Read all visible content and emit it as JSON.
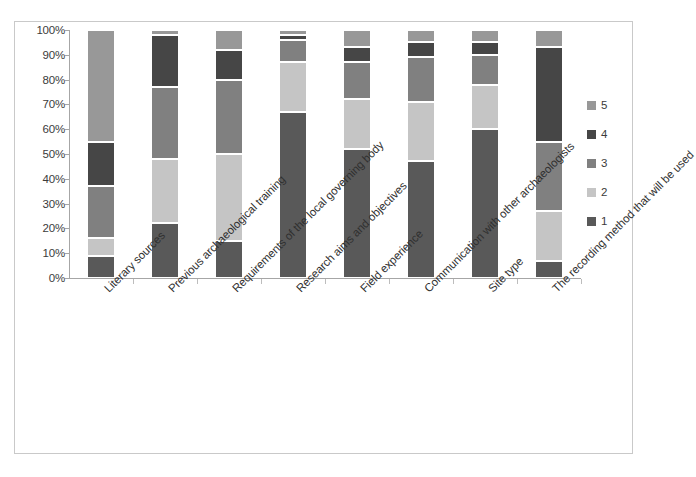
{
  "chart_data": {
    "type": "bar",
    "subtype": "stacked-percent",
    "title": "",
    "xlabel": "",
    "ylabel": "",
    "ylim": [
      0,
      100
    ],
    "grid": false,
    "legend_position": "right",
    "y_tick_labels": [
      "100%",
      "90%",
      "80%",
      "70%",
      "60%",
      "50%",
      "40%",
      "30%",
      "20%",
      "10%",
      "0%"
    ],
    "y_tick_values": [
      100,
      90,
      80,
      70,
      60,
      50,
      40,
      30,
      20,
      10,
      0
    ],
    "legend_order_top_to_bottom": [
      "5",
      "4",
      "3",
      "2",
      "1"
    ],
    "categories": [
      "Literary sources",
      "Previous archaeological training",
      "Requirements of the local governing body",
      "Research aims and objectives",
      "Field experience",
      "Communication with other archaeologists",
      "Site type",
      "The recording method that will be used"
    ],
    "series": [
      {
        "name": "1",
        "color": "#595959",
        "values": [
          9,
          22,
          15,
          67,
          52,
          47,
          60,
          7
        ]
      },
      {
        "name": "2",
        "color": "#c5c5c5",
        "values": [
          7,
          26,
          35,
          20,
          20,
          24,
          18,
          20
        ]
      },
      {
        "name": "3",
        "color": "#808080",
        "values": [
          21,
          29,
          30,
          9,
          15,
          18,
          12,
          28
        ]
      },
      {
        "name": "4",
        "color": "#464646",
        "values": [
          18,
          21,
          12,
          2,
          6,
          6,
          5,
          38
        ]
      },
      {
        "name": "5",
        "color": "#989898",
        "values": [
          45,
          2,
          8,
          2,
          7,
          5,
          5,
          7
        ]
      }
    ]
  },
  "legend": {
    "items": [
      {
        "label": "5",
        "color": "#989898"
      },
      {
        "label": "4",
        "color": "#464646"
      },
      {
        "label": "3",
        "color": "#808080"
      },
      {
        "label": "2",
        "color": "#c5c5c5"
      },
      {
        "label": "1",
        "color": "#595959"
      }
    ]
  }
}
